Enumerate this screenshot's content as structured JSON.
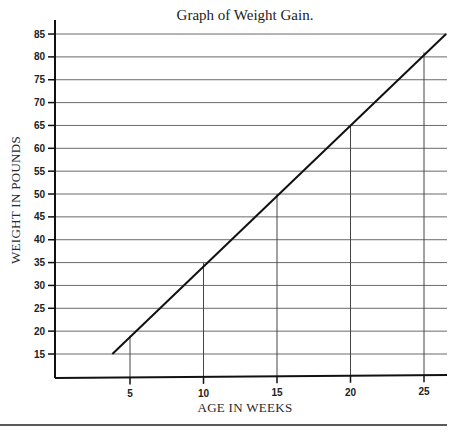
{
  "chart_data": {
    "type": "line",
    "title": "Graph of Weight  Gain.",
    "xlabel": "AGE IN WEEKS",
    "ylabel": "WEIGHT IN POUNDS",
    "x_ticks": [
      5,
      10,
      15,
      20,
      25
    ],
    "y_ticks": [
      15,
      20,
      25,
      30,
      35,
      40,
      45,
      50,
      55,
      60,
      65,
      70,
      75,
      80,
      85
    ],
    "xlim": [
      0,
      26.5
    ],
    "ylim": [
      10,
      85
    ],
    "grid": {
      "horizontal": true,
      "vertical": false
    },
    "drop_lines_at_x": [
      5,
      10,
      15,
      20,
      25
    ],
    "legend": null,
    "series": [
      {
        "name": "Weight",
        "x": [
          3.8,
          5,
          10,
          15,
          20,
          25,
          26.5
        ],
        "values": [
          15,
          19,
          35,
          50,
          65,
          81,
          85
        ]
      }
    ]
  },
  "colors": {
    "line": "#111111",
    "grid": "#6a6a6a",
    "axis": "#111111",
    "background": "#ffffff"
  }
}
